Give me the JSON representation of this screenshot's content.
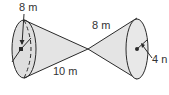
{
  "figure": {
    "labels": {
      "left_radius": "8 m",
      "slant": "8 m",
      "length": "10 m",
      "right_radius": "4 n"
    },
    "colors": {
      "stroke": "#2a2a2a",
      "fill": "#e6e6e6",
      "base_fill": "#dcdcdc",
      "text": "#333333"
    }
  }
}
